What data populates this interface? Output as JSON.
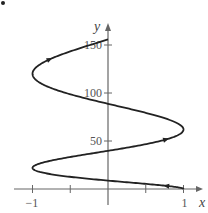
{
  "chart_data": {
    "type": "line",
    "title": "",
    "xlabel": "x",
    "ylabel": "y",
    "xlim": [
      -1.1,
      1.3
    ],
    "ylim": [
      -15,
      165
    ],
    "xticks": [
      -1,
      -0.5,
      0.5,
      1
    ],
    "xtick_labels": [
      "-1",
      "",
      "",
      "1"
    ],
    "yticks": [
      50,
      100,
      150
    ],
    "ytick_labels": [
      "50",
      "100",
      "150"
    ],
    "grid": false,
    "legend": null,
    "series": [
      {
        "name": "parametric curve",
        "description": "x = cos(pi*u), y = 13u + 9u^2, u from 0 to 3.5; oscillates between x=-1 and x=1 while y increases",
        "points": [
          [
            1,
            0
          ],
          [
            0,
            7
          ],
          [
            -1,
            22
          ],
          [
            0,
            40
          ],
          [
            1,
            62
          ],
          [
            0,
            86
          ],
          [
            -1,
            120
          ],
          [
            -0.7,
            138
          ],
          [
            0,
            158
          ]
        ],
        "direction_arrows_at": [
          [
            -0.65,
            12
          ],
          [
            0.83,
            72
          ],
          [
            -0.65,
            145
          ]
        ]
      }
    ],
    "marker_point": {
      "x": -1.5,
      "y": 170
    }
  }
}
